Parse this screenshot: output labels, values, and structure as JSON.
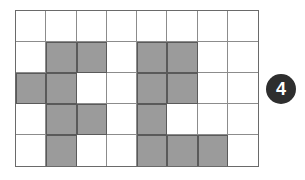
{
  "figure": {
    "grid": {
      "columns": 8,
      "rows": 5,
      "shaded_color": "#9b9b9b",
      "empty_color": "#ffffff",
      "shaded_cells": [
        [
          1,
          1
        ],
        [
          1,
          2
        ],
        [
          1,
          4
        ],
        [
          1,
          5
        ],
        [
          2,
          0
        ],
        [
          2,
          1
        ],
        [
          2,
          4
        ],
        [
          2,
          5
        ],
        [
          3,
          1
        ],
        [
          3,
          2
        ],
        [
          3,
          4
        ],
        [
          4,
          1
        ],
        [
          4,
          4
        ],
        [
          4,
          5
        ],
        [
          4,
          6
        ]
      ],
      "matrix": [
        [
          0,
          0,
          0,
          0,
          0,
          0,
          0,
          0
        ],
        [
          0,
          1,
          1,
          0,
          1,
          1,
          0,
          0
        ],
        [
          1,
          1,
          0,
          0,
          1,
          1,
          0,
          0
        ],
        [
          0,
          1,
          1,
          0,
          1,
          0,
          0,
          0
        ],
        [
          0,
          1,
          0,
          0,
          1,
          1,
          1,
          0
        ]
      ]
    },
    "badge": {
      "label": "4",
      "color": "#2e2e2e",
      "text_color": "#ffffff"
    }
  }
}
